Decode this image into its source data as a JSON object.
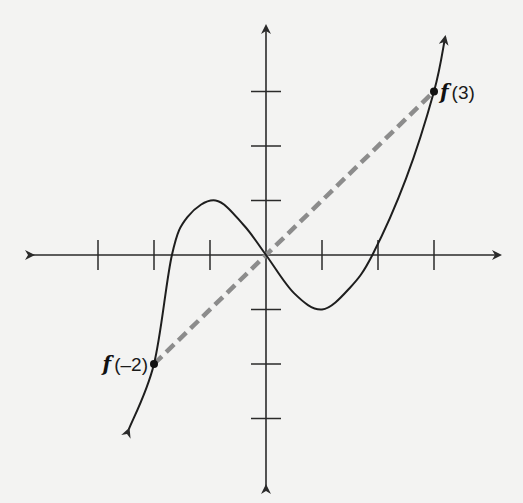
{
  "chart_data": {
    "type": "line",
    "title": "",
    "xlabel": "",
    "ylabel": "",
    "grid": false,
    "legend": null,
    "x_ticks": [
      -3,
      -2,
      -1,
      1,
      2,
      3
    ],
    "y_ticks": [
      -3,
      -2,
      -1,
      1,
      2,
      3
    ],
    "xlim": [
      -4.1,
      4.2
    ],
    "ylim": [
      -4.2,
      4.2
    ],
    "series": [
      {
        "name": "f(x)",
        "style": "solid",
        "color": "#1e1e1e",
        "x": [
          -2.45,
          -2.0,
          -1.68,
          -1.4,
          -0.9,
          -0.4,
          0.0,
          0.5,
          1.0,
          1.5,
          1.9,
          2.5,
          3.0,
          3.2
        ],
        "y": [
          -3.2,
          -2.0,
          0.0,
          0.7,
          1.0,
          0.55,
          0.0,
          -0.7,
          -1.0,
          -0.6,
          0.0,
          1.4,
          3.0,
          4.0
        ],
        "arrows": [
          "start",
          "end"
        ]
      },
      {
        "name": "secant",
        "style": "dashed",
        "color": "#8c8c8c",
        "x": [
          -2,
          3
        ],
        "y": [
          -2,
          3
        ]
      }
    ],
    "points": [
      {
        "label_fn": "f",
        "label_arg": "(–2)",
        "x": -2,
        "y": -2,
        "label_side": "left"
      },
      {
        "label_fn": "f",
        "label_arg": "(3)",
        "x": 3,
        "y": 3,
        "label_side": "right"
      }
    ],
    "annotations": [
      "f(–2)",
      "f(3)"
    ]
  },
  "colors": {
    "background": "#f3f3f2",
    "axis": "#2a2a2a",
    "curve": "#1e1e1e",
    "secant": "#8c8c8c"
  }
}
